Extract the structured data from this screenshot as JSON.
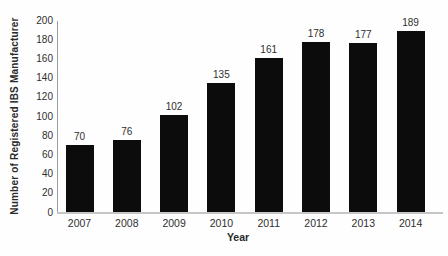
{
  "chart_data": {
    "type": "bar",
    "title": "",
    "categories": [
      "2007",
      "2008",
      "2009",
      "2010",
      "2011",
      "2012",
      "2013",
      "2014"
    ],
    "values": [
      70,
      76,
      102,
      135,
      161,
      178,
      177,
      189
    ],
    "xlabel": "Year",
    "ylabel": "Number of Registered IBS Manufacturer",
    "ylim": [
      0,
      200
    ],
    "yticks": [
      0,
      20,
      40,
      60,
      80,
      100,
      120,
      140,
      160,
      180,
      200
    ],
    "grid": false,
    "legend": false,
    "bar_color": "#0c0c0c",
    "y_axis_color": "#9e9e9e",
    "x_axis_color": "#c6c6c6",
    "text_color": "#2e2e2e",
    "background_color": "#fefefe"
  }
}
